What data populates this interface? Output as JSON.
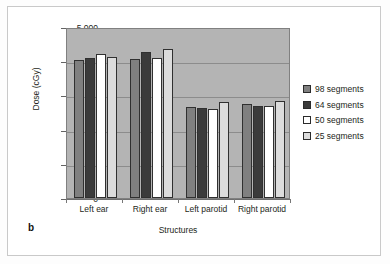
{
  "figure": {
    "panel_label": "b"
  },
  "chart_data": {
    "type": "bar",
    "title": "",
    "xlabel": "Structures",
    "ylabel": "Dose (cGy)",
    "ylim": [
      0,
      5000
    ],
    "ytick_labels": [
      "0",
      "1,000",
      "2,000",
      "3,000",
      "4,000",
      "5,000"
    ],
    "ytick_values": [
      0,
      1000,
      2000,
      3000,
      4000,
      5000
    ],
    "grid": true,
    "legend_position": "right",
    "categories": [
      "Left ear",
      "Right ear",
      "Left parotid",
      "Right parotid"
    ],
    "series": [
      {
        "name": "98 segments",
        "color": "#808080",
        "values": [
          4050,
          4060,
          2650,
          2740
        ]
      },
      {
        "name": "64 segments",
        "color": "#3b3b3b",
        "values": [
          4090,
          4260,
          2620,
          2700
        ]
      },
      {
        "name": "50 segments",
        "color": "#ffffff",
        "values": [
          4220,
          4100,
          2610,
          2680
        ]
      },
      {
        "name": "25 segments",
        "color": "#dcdcdc",
        "values": [
          4110,
          4360,
          2810,
          2850
        ]
      }
    ],
    "plot_background": "#b4b4b4",
    "gridline_color": "#8c8c8c"
  }
}
